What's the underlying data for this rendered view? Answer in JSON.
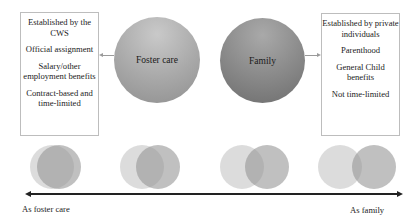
{
  "left_box": {
    "items": [
      "Established by the CWS",
      "Official assignment",
      "Salary/other employment benefits",
      "Contract-based and time-limited"
    ]
  },
  "right_box": {
    "items": [
      "Established by private individuals",
      "Parenthood",
      "General Child benefits",
      "Not time-limited"
    ]
  },
  "circles": {
    "foster": "Foster care",
    "family": "Family"
  },
  "continuum": {
    "left_label": "As foster care",
    "right_label": "As family",
    "venn_count": 4
  }
}
